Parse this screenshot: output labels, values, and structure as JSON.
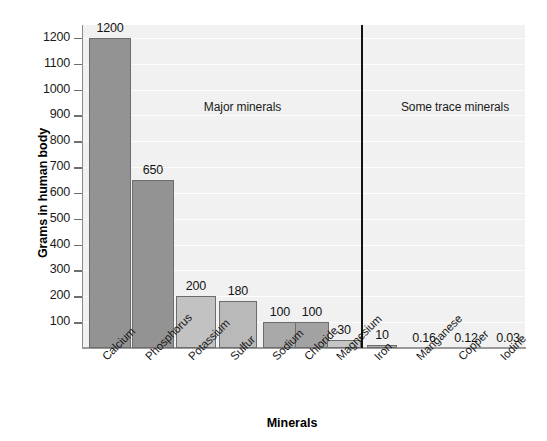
{
  "chart_data": {
    "type": "bar",
    "title": "",
    "xlabel": "Minerals",
    "ylabel": "Grams in human body",
    "categories": [
      "Calcium",
      "Phosphorus",
      "Potassium",
      "Sulfur",
      "Sodium",
      "Chloride",
      "Magnesium",
      "Iron",
      "Manganese",
      "Copper",
      "Iodine"
    ],
    "values": [
      1200,
      650,
      200,
      180,
      100,
      100,
      30,
      10,
      0.16,
      0.12,
      0.03
    ],
    "value_labels": [
      "1200",
      "650",
      "200",
      "180",
      "100",
      "100",
      "30",
      "10",
      "0.16",
      "0.12",
      "0.03"
    ],
    "ylim": [
      0,
      1250
    ],
    "yticks": [
      100,
      200,
      300,
      400,
      500,
      600,
      700,
      800,
      900,
      1000,
      1100,
      1200
    ],
    "ytick_labels": [
      "100",
      "200",
      "300",
      "400",
      "500",
      "600",
      "700",
      "800",
      "900",
      "1000",
      "1100",
      "1200"
    ],
    "grid": true,
    "legend": "none",
    "groups": [
      {
        "name": "Major minerals",
        "label": "Major minerals",
        "categories": [
          "Calcium",
          "Phosphorus",
          "Potassium",
          "Sulfur",
          "Sodium",
          "Chloride",
          "Magnesium"
        ]
      },
      {
        "name": "Some trace minerals",
        "label": "Some trace minerals",
        "categories": [
          "Iron",
          "Manganese",
          "Copper",
          "Iodine"
        ]
      }
    ],
    "annotations": [
      "Major minerals",
      "Some trace minerals"
    ],
    "colors": {
      "bar_dark": "#939393",
      "bar_mid": "#a8a8a8",
      "bar_light": "#c3c3c3",
      "bar_outline": "#6d6d6d",
      "plot_background": "#f1f1f1",
      "gridline": "#fdfdfd",
      "axis": "#8a8a8a",
      "divider": "#111111",
      "text": "#141414",
      "page_background": "#ffffff"
    },
    "bar_shades": [
      "#939393",
      "#939393",
      "#c2c2c2",
      "#b9b9b9",
      "#a9a9a9",
      "#a2a2a2",
      "#c5c5c5",
      "#b0b0b0",
      "#c3c3c3",
      "#c3c3c3",
      "#c3c3c3"
    ]
  }
}
